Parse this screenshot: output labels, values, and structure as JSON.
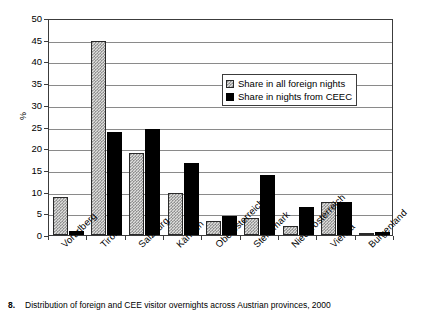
{
  "chart_data": {
    "type": "bar",
    "title": "",
    "xlabel": "",
    "ylabel": "%",
    "ylim": [
      0,
      50
    ],
    "ytick_step": 5,
    "yticks": [
      "50",
      "45",
      "40",
      "35",
      "30",
      "25",
      "20",
      "15",
      "10",
      "5",
      "0"
    ],
    "grid": true,
    "legend_position": "upper-right-inside",
    "categories": [
      "Vorarlberg",
      "Tirol",
      "Salzburg",
      "Kärnten",
      "Oberösterreich",
      "Steiermark",
      "Niederösterreich",
      "Vienna",
      "Burgenland"
    ],
    "series": [
      {
        "name": "Share in all foreign nights",
        "color": "#dededc",
        "pattern": "dotted",
        "values": [
          8.7,
          44.8,
          18.8,
          9.7,
          3.2,
          3.9,
          2.0,
          7.6,
          0.4
        ]
      },
      {
        "name": "Share in nights from CEEC",
        "color": "#000000",
        "pattern": "solid",
        "values": [
          1.0,
          23.7,
          24.4,
          16.7,
          4.4,
          13.8,
          6.4,
          7.6,
          0.6
        ]
      }
    ]
  },
  "legend": {
    "entries": [
      "Share in all foreign nights",
      "Share in nights from CEEC"
    ]
  },
  "caption": {
    "number": "8.",
    "text": "Distribution of foreign and CEE visitor overnights across Austrian provinces, 2000"
  }
}
